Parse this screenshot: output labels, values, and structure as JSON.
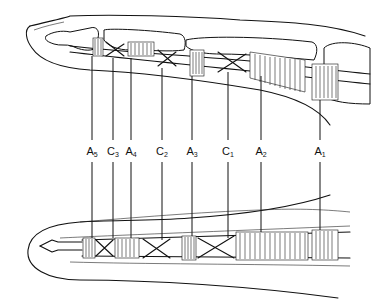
{
  "diagram": {
    "labels": [
      {
        "id": "A5",
        "letter": "A",
        "sub": "5",
        "x": 92
      },
      {
        "id": "C3",
        "letter": "C",
        "sub": "3",
        "x": 113
      },
      {
        "id": "A4",
        "letter": "A",
        "sub": "4",
        "x": 131
      },
      {
        "id": "C2",
        "letter": "C",
        "sub": "2",
        "x": 162
      },
      {
        "id": "A3",
        "letter": "A",
        "sub": "3",
        "x": 192
      },
      {
        "id": "C1",
        "letter": "C",
        "sub": "1",
        "x": 228
      },
      {
        "id": "A2",
        "letter": "A",
        "sub": "2",
        "x": 261
      },
      {
        "id": "A1",
        "letter": "A",
        "sub": "1",
        "x": 320
      }
    ]
  }
}
